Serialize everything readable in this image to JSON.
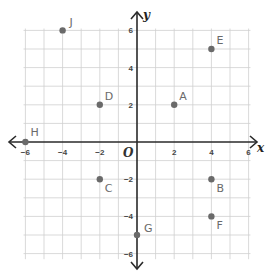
{
  "chart_data": {
    "type": "scatter",
    "title": "",
    "xlabel": "x",
    "ylabel": "y",
    "origin_label": "O",
    "xlim": [
      -6,
      6
    ],
    "ylim": [
      -6,
      6
    ],
    "grid": true,
    "x_ticks": [
      -6,
      -4,
      -2,
      2,
      4,
      6
    ],
    "y_ticks": [
      6,
      4,
      2,
      -2,
      -4,
      -6
    ],
    "x_tick_labels": [
      "−6",
      "−4",
      "−2",
      "2",
      "4",
      "6"
    ],
    "y_tick_labels": [
      "6",
      "4",
      "2",
      "−2",
      "−4",
      "−6"
    ],
    "points": [
      {
        "label": "A",
        "x": 2,
        "y": 2
      },
      {
        "label": "B",
        "x": 4,
        "y": -2
      },
      {
        "label": "C",
        "x": -2,
        "y": -2
      },
      {
        "label": "D",
        "x": -2,
        "y": 2
      },
      {
        "label": "E",
        "x": 4,
        "y": 5
      },
      {
        "label": "F",
        "x": 4,
        "y": -4
      },
      {
        "label": "G",
        "x": 0,
        "y": -5
      },
      {
        "label": "H",
        "x": -6,
        "y": 0
      },
      {
        "label": "J",
        "x": -4,
        "y": 6
      }
    ],
    "colors": {
      "grid": "#cfcfcf",
      "axis": "#2a2a2a",
      "point": "#6a6a6a"
    }
  }
}
